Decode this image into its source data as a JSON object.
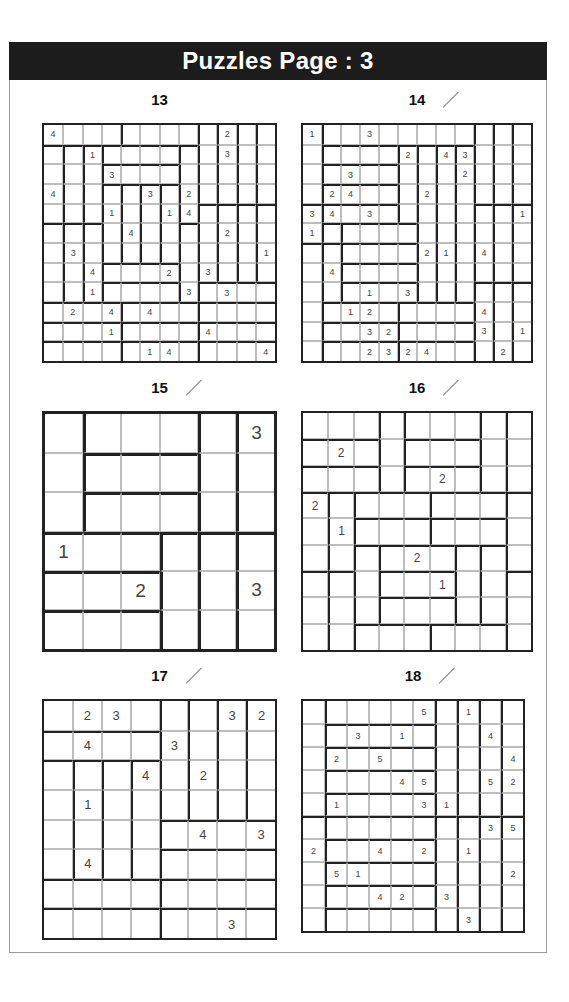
{
  "header": {
    "title": "Puzzles Page :  3"
  },
  "puzzles": [
    {
      "number": "13",
      "checkmark": false,
      "box": {
        "x": 42,
        "y": 123,
        "w": 235,
        "h": 240
      },
      "size": 12,
      "font": 9,
      "regions": [
        "AAAABBBBCDEF",
        "GHIJJJJKCDEF",
        "GHILLLLKCDEF",
        "GHIMNOPKCDEF",
        "GHIMNOPKQRST",
        "UVWMNOPXQRST",
        "UVWMNOPXQRST",
        "UVWYYYYXQRST",
        "UVWZZZZXaaaa",
        "bbbbccccdddd",
        "eeeeffffgggg",
        "hhhhiiiijjjj"
      ],
      "clues": [
        "4........2..",
        "..1......3..",
        "...3........",
        "4....3.2....",
        "...1..14....",
        "....4....2..",
        ".3.........1",
        "..4...2.3...",
        "..1....3.3..",
        ".2.4.4......",
        "...1....4...",
        ".....14....4"
      ]
    },
    {
      "number": "14",
      "checkmark": true,
      "box": {
        "x": 301,
        "y": 123,
        "w": 232,
        "h": 240
      },
      "size": 12,
      "font": 9,
      "regions": [
        "ABBBBBBBBCDE",
        "AFFFFGHIJCDE",
        "ALLLLGHIJCDE",
        "AMMMMGHIJCDE",
        "NOOOOGHIJPQR",
        "NSTTTTHIJPQR",
        "UVWWWWHIJPQR",
        "UVXXXXHIJPQR",
        "UVYYYYHIJZab",
        "UccccddddZab",
        "UeeeeffffZab",
        "UggggjjjjZab"
      ],
      "clues": [
        "1..3........",
        ".....2.43...",
        "..3.....2...",
        ".24...2.....",
        "34.3.......1",
        "1...........",
        "......21.4..",
        ".4..........",
        "...1.3......",
        "..12.....4..",
        "...32....3.1",
        "...2324...2."
      ]
    },
    {
      "number": "15",
      "checkmark": true,
      "box": {
        "x": 42,
        "y": 411,
        "w": 235,
        "h": 241
      },
      "size": 6,
      "font": 19,
      "big": true,
      "regions": [
        "ABBBCD",
        "AEEECD",
        "AFFFCD",
        "GGGHIJ",
        "KKKHIJ",
        "LLLHIJ"
      ],
      "clues": [
        ".....3",
        "......",
        "......",
        "1.....",
        "..2..3",
        "......"
      ]
    },
    {
      "number": "16",
      "checkmark": true,
      "box": {
        "x": 301,
        "y": 411,
        "w": 232,
        "h": 241
      },
      "size": 9,
      "font": 12,
      "regions": [
        "AAABCCCDE",
        "FFFBGGGDE",
        "HHHBIIIDE",
        "JKLLLMMMN",
        "JKOOOPPPN",
        "JKQRRRSTN",
        "UVQWWWSTX",
        "UVQYYYSTX",
        "UVZZZaaaX"
      ],
      "clues": [
        ".........",
        ".2.......",
        ".....2...",
        "2........",
        ".1.......",
        "....2....",
        ".....1...",
        ".........",
        "........."
      ]
    },
    {
      "number": "17",
      "checkmark": true,
      "box": {
        "x": 42,
        "y": 699,
        "w": 235,
        "h": 241
      },
      "size": 8,
      "font": 13,
      "regions": [
        "AAAABCDE",
        "FFFFBCDE",
        "GHIJBCDE",
        "GHIJBCDE",
        "GHIJKKKK",
        "GHIJLLLL",
        "MMMMNNNN",
        "OOOOPPPP"
      ],
      "clues": [
        ".23...32",
        ".4..3...",
        "...4.2..",
        ".1......",
        ".....4.3",
        ".4......",
        "........",
        "......3."
      ]
    },
    {
      "number": "18",
      "checkmark": true,
      "box": {
        "x": 301,
        "y": 699,
        "w": 224,
        "h": 234
      },
      "size": 10,
      "font": 9,
      "regions": [
        "ABBBBBCDEF",
        "AGGGGGCDEF",
        "AHHHHHCDEF",
        "AIIIIICDEF",
        "AJJJJJCDEF",
        "KLLLLLMNOP",
        "KQQQQQMNOP",
        "KRRRRRMNOP",
        "KSSSSSMNOP",
        "KTTTTTMNOP"
      ],
      "clues": [
        ".....5.1..",
        "..3.1...4.",
        ".2.5.....4",
        "....45..52",
        ".1...31...",
        "........35",
        "2..4.2.1..",
        ".51......2",
        "...42.3...",
        ".......3.."
      ]
    }
  ]
}
